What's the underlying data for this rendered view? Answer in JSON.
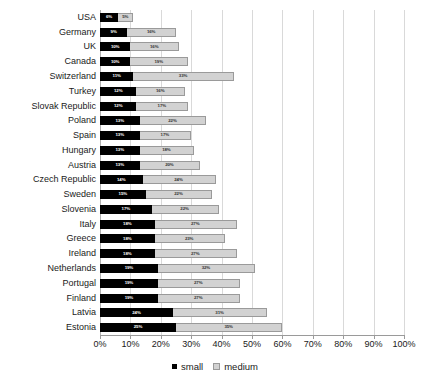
{
  "chart_data": {
    "type": "bar",
    "orientation": "horizontal",
    "stacked": true,
    "title": "",
    "xlabel": "",
    "ylabel": "",
    "xlim": [
      0,
      100
    ],
    "xticks": [
      "0%",
      "10%",
      "20%",
      "30%",
      "40%",
      "50%",
      "60%",
      "70%",
      "80%",
      "90%",
      "100%"
    ],
    "xtick_values": [
      0,
      10,
      20,
      30,
      40,
      50,
      60,
      70,
      80,
      90,
      100
    ],
    "grid": true,
    "legend_position": "bottom",
    "categories": [
      "USA",
      "Germany",
      "UK",
      "Canada",
      "Switzerland",
      "Turkey",
      "Slovak Republic",
      "Poland",
      "Spain",
      "Hungary",
      "Austria",
      "Czech Republic",
      "Sweden",
      "Slovenia",
      "Italy",
      "Greece",
      "Ireland",
      "Netherlands",
      "Portugal",
      "Finland",
      "Latvia",
      "Estonia"
    ],
    "series": [
      {
        "name": "small",
        "color": "#000000",
        "values": [
          6,
          9,
          10,
          10,
          11,
          12,
          12,
          13,
          13,
          13,
          13,
          14,
          15,
          17,
          18,
          18,
          18,
          19,
          19,
          19,
          24,
          25
        ],
        "labels": [
          "6%",
          "9%",
          "10%",
          "10%",
          "11%",
          "12%",
          "12%",
          "13%",
          "13%",
          "13%",
          "13%",
          "14%",
          "15%",
          "17%",
          "18%",
          "18%",
          "18%",
          "19%",
          "19%",
          "19%",
          "24%",
          "25%"
        ]
      },
      {
        "name": "medium",
        "color": "#d2d2d2",
        "values": [
          5,
          16,
          16,
          19,
          33,
          16,
          17,
          22,
          17,
          18,
          20,
          24,
          22,
          22,
          27,
          23,
          27,
          32,
          27,
          27,
          31,
          35
        ],
        "labels": [
          "5%",
          "16%",
          "16%",
          "19%",
          "33%",
          "16%",
          "17%",
          "22%",
          "17%",
          "18%",
          "20%",
          "24%",
          "22%",
          "22%",
          "27%",
          "23%",
          "27%",
          "32%",
          "27%",
          "27%",
          "31%",
          "35%"
        ]
      }
    ]
  },
  "legend": {
    "items": [
      {
        "label": "small",
        "swatch": "small"
      },
      {
        "label": "medium",
        "swatch": "medium"
      }
    ]
  }
}
